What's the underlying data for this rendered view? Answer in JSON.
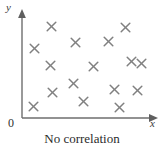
{
  "chart_data": {
    "type": "scatter",
    "title": "",
    "caption": "No correlation",
    "xlabel": "x",
    "ylabel": "y",
    "origin_label": "0",
    "grid": false,
    "legend": null,
    "axis_style": "arrow-tipped open axes, no tick marks, no tick labels",
    "xlim": [
      0,
      10
    ],
    "ylim": [
      0,
      10
    ],
    "marker": "x",
    "marker_color": "#808080",
    "axis_color": "#6e6e6e",
    "n_points": 16,
    "points": [
      {
        "px": 51,
        "py": 26
      },
      {
        "px": 125,
        "py": 27
      },
      {
        "px": 34,
        "py": 48
      },
      {
        "px": 108,
        "py": 41
      },
      {
        "px": 75,
        "py": 42
      },
      {
        "px": 50,
        "py": 65
      },
      {
        "px": 93,
        "py": 66
      },
      {
        "px": 131,
        "py": 61
      },
      {
        "px": 141,
        "py": 63
      },
      {
        "px": 73,
        "py": 83
      },
      {
        "px": 52,
        "py": 92
      },
      {
        "px": 114,
        "py": 89
      },
      {
        "px": 137,
        "py": 90
      },
      {
        "px": 83,
        "py": 101
      },
      {
        "px": 119,
        "py": 107
      },
      {
        "px": 33,
        "py": 106
      }
    ]
  },
  "axes": {
    "origin_px": {
      "x": 22,
      "y": 118
    },
    "x_axis_end_px": 158,
    "y_axis_top_px": 11
  }
}
